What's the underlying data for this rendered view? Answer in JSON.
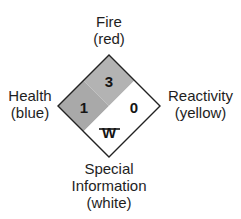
{
  "diagram": {
    "type": "NFPA 704 hazard diamond",
    "labels": {
      "fire": {
        "title": "Fire",
        "color_name": "(red)"
      },
      "health": {
        "title": "Health",
        "color_name": "(blue)"
      },
      "reactivity": {
        "title": "Reactivity",
        "color_name": "(yellow)"
      },
      "special": {
        "line1": "Special",
        "line2": "Information",
        "color_name": "(white)"
      }
    },
    "ratings": {
      "fire": "3",
      "health": "1",
      "reactivity": "0",
      "special": "W"
    },
    "special_symbol": "no-water-icon",
    "colors": {
      "fire_fill": "#b3b3b3",
      "health_fill": "#a9a9a9",
      "reactivity_fill": "#ffffff",
      "special_fill": "#ffffff",
      "outline": "#222222"
    }
  }
}
